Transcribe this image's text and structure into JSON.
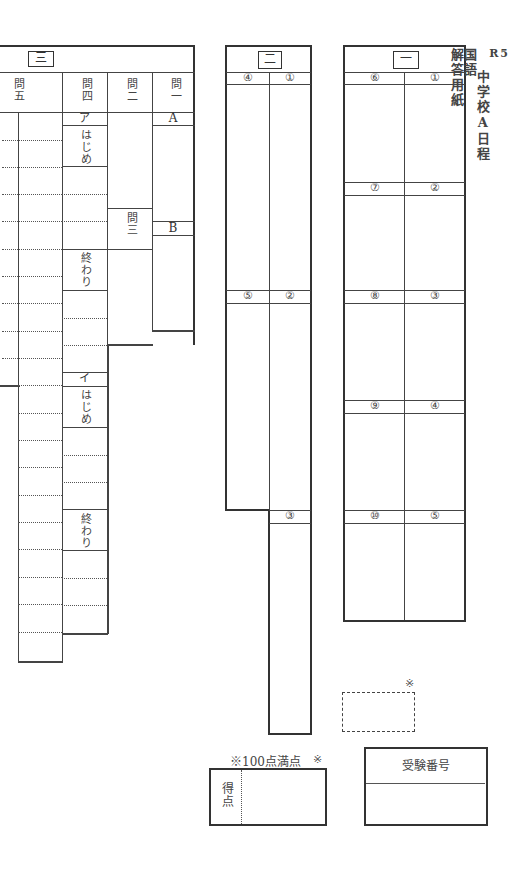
{
  "title": {
    "year": "R5",
    "school": "中学校A日程",
    "subject": "国語",
    "doc": "解答用紙"
  },
  "section_three": {
    "label": "三",
    "questions": {
      "q5": "問五",
      "q4": "問四",
      "q2": "問二",
      "q3": "問三",
      "q1": "問一"
    },
    "q4_parts": {
      "a_mark": "ア",
      "a_start": "はじめ",
      "a_end": "終わり",
      "i_mark": "イ",
      "i_start": "はじめ",
      "i_end": "終わり"
    },
    "q1_parts": {
      "a": "A",
      "b": "B"
    }
  },
  "section_two": {
    "label": "二",
    "items": [
      "④",
      "①",
      "⑤",
      "②",
      "③"
    ]
  },
  "section_one": {
    "label": "一",
    "items": [
      "⑥",
      "①",
      "⑦",
      "②",
      "⑧",
      "③",
      "⑨",
      "④",
      "⑩",
      "⑤"
    ]
  },
  "score": {
    "note": "※100点満点",
    "mark": "※",
    "label": "得点"
  },
  "examinee": {
    "label": "受験番号"
  },
  "staff_mark": "※"
}
